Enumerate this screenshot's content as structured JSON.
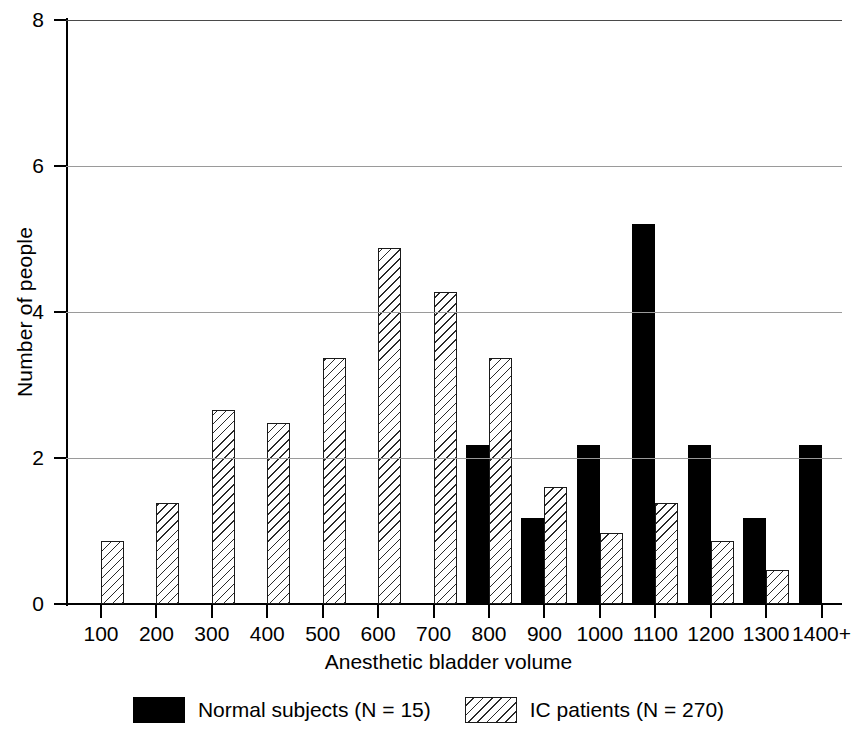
{
  "chart_data": {
    "type": "bar",
    "title": "",
    "xlabel": "Anesthetic bladder volume",
    "ylabel": "Number of people",
    "categories": [
      "100",
      "200",
      "300",
      "400",
      "500",
      "600",
      "700",
      "800",
      "900",
      "1000",
      "1100",
      "1200",
      "1300",
      "1400+"
    ],
    "ylim": [
      0,
      8
    ],
    "yticks": [
      0,
      2,
      4,
      6,
      8
    ],
    "ytick_labels": [
      "0",
      "2",
      "4",
      "6",
      "8"
    ],
    "grid": "horizontal",
    "legend_position": "bottom-center",
    "series": [
      {
        "name": "Normal subjects (N = 15)",
        "style": "solid-black",
        "color": "#000000",
        "values": [
          null,
          null,
          null,
          null,
          null,
          null,
          null,
          2.18,
          1.18,
          2.18,
          5.2,
          2.18,
          1.18,
          2.18
        ]
      },
      {
        "name": "IC patients (N = 270)",
        "style": "diagonal-hatch",
        "color": "#ffffff",
        "values": [
          0.86,
          1.38,
          2.66,
          2.48,
          3.37,
          4.88,
          4.27,
          3.37,
          1.6,
          0.97,
          1.38,
          0.86,
          0.47,
          null
        ]
      }
    ]
  },
  "axes": {
    "y_title": "Number of people",
    "x_title": "Anesthetic bladder volume",
    "y_tick_labels": [
      "8",
      "6",
      "4",
      "2",
      "0"
    ],
    "x_tick_labels": [
      "100",
      "200",
      "300",
      "400",
      "500",
      "600",
      "700",
      "800",
      "900",
      "1000",
      "1100",
      "1200",
      "1300",
      "1400+"
    ]
  },
  "legend": {
    "items": [
      {
        "label": "Normal subjects (N = 15)",
        "swatch": "solid-black-swatch"
      },
      {
        "label": "IC patients (N = 270)",
        "swatch": "hatched-swatch"
      }
    ]
  },
  "colors": {
    "series_normal": "#000000",
    "series_ic_fill": "#ffffff",
    "series_ic_stroke": "#1b1b1b",
    "axis": "#000000",
    "gridline": "#9a9a9a",
    "background": "#ffffff"
  }
}
